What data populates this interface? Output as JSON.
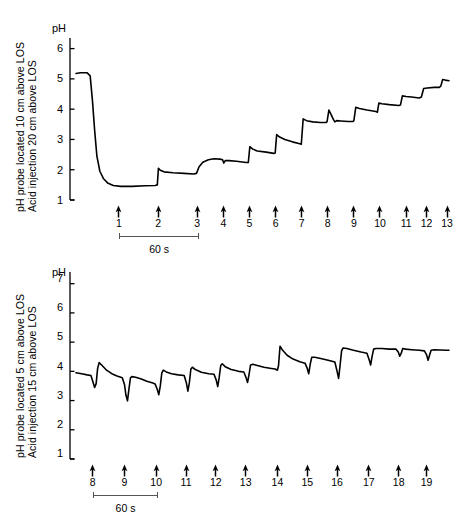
{
  "figure": {
    "background": "#ffffff",
    "trace_color": "#000000",
    "axis_color": "#000000"
  },
  "panels": [
    {
      "id": "top",
      "ylabel_line1": "pH probe located 10 cm above LOS",
      "ylabel_line2": "Acid injection 20 cm above LOS",
      "axis_title": "pH",
      "scalebar_label": "60 s"
    },
    {
      "id": "bottom",
      "ylabel_line1": "pH probe located 5 cm above LOS",
      "ylabel_line2": "Acid injection 15 cm above LOS",
      "axis_title": "pH",
      "scalebar_label": "60 s"
    }
  ],
  "chart_data": [
    {
      "type": "line",
      "id": "top-panel",
      "title": "pH probe located 10 cm above LOS / Acid injection 20 cm above LOS",
      "xlabel": "",
      "ylabel": "pH",
      "ylim": [
        1,
        6.5
      ],
      "yticks": [
        6,
        5,
        4,
        3,
        2,
        1
      ],
      "xlim": [
        0,
        100
      ],
      "grid": false,
      "legend": null,
      "time_scalebar_seconds": 60,
      "injection_markers": [
        {
          "label": "1",
          "x": 11.5
        },
        {
          "label": "2",
          "x": 22.0
        },
        {
          "label": "3",
          "x": 32.5
        },
        {
          "label": "4",
          "x": 39.5
        },
        {
          "label": "5",
          "x": 46.5
        },
        {
          "label": "6",
          "x": 53.5
        },
        {
          "label": "7",
          "x": 60.5
        },
        {
          "label": "8",
          "x": 67.5
        },
        {
          "label": "9",
          "x": 74.5
        },
        {
          "label": "10",
          "x": 81.5
        },
        {
          "label": "11",
          "x": 88.5
        },
        {
          "label": "12",
          "x": 94.0
        },
        {
          "label": "13",
          "x": 99.5
        }
      ],
      "series": [
        {
          "name": "pH trace (10 cm above LOS)",
          "points": [
            [
              0.0,
              5.18
            ],
            [
              1.2,
              5.2
            ],
            [
              3.0,
              5.2
            ],
            [
              3.8,
              5.1
            ],
            [
              4.4,
              4.3
            ],
            [
              5.0,
              3.3
            ],
            [
              5.6,
              2.45
            ],
            [
              6.4,
              1.95
            ],
            [
              7.4,
              1.7
            ],
            [
              8.6,
              1.55
            ],
            [
              10.0,
              1.48
            ],
            [
              12.0,
              1.45
            ],
            [
              15.0,
              1.45
            ],
            [
              18.5,
              1.47
            ],
            [
              21.2,
              1.48
            ],
            [
              21.8,
              1.5
            ],
            [
              22.1,
              2.05
            ],
            [
              22.6,
              1.98
            ],
            [
              23.6,
              1.93
            ],
            [
              26.0,
              1.9
            ],
            [
              29.0,
              1.88
            ],
            [
              31.5,
              1.86
            ],
            [
              32.3,
              1.88
            ],
            [
              33.0,
              2.1
            ],
            [
              34.0,
              2.25
            ],
            [
              35.5,
              2.33
            ],
            [
              37.0,
              2.36
            ],
            [
              38.6,
              2.35
            ],
            [
              39.3,
              2.33
            ],
            [
              39.6,
              2.22
            ],
            [
              40.0,
              2.3
            ],
            [
              41.0,
              2.3
            ],
            [
              43.0,
              2.28
            ],
            [
              45.6,
              2.24
            ],
            [
              46.2,
              2.24
            ],
            [
              46.6,
              2.76
            ],
            [
              47.4,
              2.68
            ],
            [
              48.6,
              2.62
            ],
            [
              51.0,
              2.58
            ],
            [
              53.0,
              2.54
            ],
            [
              53.4,
              2.55
            ],
            [
              53.8,
              3.16
            ],
            [
              54.6,
              3.08
            ],
            [
              56.0,
              3.0
            ],
            [
              58.0,
              2.92
            ],
            [
              60.0,
              2.86
            ],
            [
              60.4,
              2.84
            ],
            [
              60.9,
              3.68
            ],
            [
              61.8,
              3.62
            ],
            [
              63.5,
              3.58
            ],
            [
              65.5,
              3.56
            ],
            [
              67.0,
              3.56
            ],
            [
              67.3,
              3.58
            ],
            [
              67.8,
              3.97
            ],
            [
              68.4,
              3.82
            ],
            [
              69.0,
              3.66
            ],
            [
              69.4,
              3.58
            ],
            [
              69.9,
              3.62
            ],
            [
              71.0,
              3.61
            ],
            [
              73.0,
              3.59
            ],
            [
              74.2,
              3.59
            ],
            [
              74.5,
              3.62
            ],
            [
              75.0,
              4.06
            ],
            [
              76.0,
              4.02
            ],
            [
              78.0,
              3.97
            ],
            [
              80.4,
              3.92
            ],
            [
              80.8,
              3.9
            ],
            [
              81.2,
              4.2
            ],
            [
              82.0,
              4.18
            ],
            [
              84.0,
              4.15
            ],
            [
              86.5,
              4.12
            ],
            [
              87.0,
              4.14
            ],
            [
              87.5,
              4.44
            ],
            [
              88.5,
              4.42
            ],
            [
              90.0,
              4.4
            ],
            [
              92.0,
              4.37
            ],
            [
              92.6,
              4.4
            ],
            [
              93.2,
              4.68
            ],
            [
              94.2,
              4.7
            ],
            [
              96.0,
              4.72
            ],
            [
              97.4,
              4.72
            ],
            [
              97.8,
              4.76
            ],
            [
              98.3,
              4.98
            ],
            [
              99.0,
              4.96
            ],
            [
              100.0,
              4.94
            ]
          ]
        }
      ]
    },
    {
      "type": "line",
      "id": "bottom-panel",
      "title": "pH probe located 5 cm above LOS / Acid injection 15 cm above LOS",
      "xlabel": "",
      "ylabel": "pH",
      "ylim": [
        1,
        7.5
      ],
      "yticks": [
        7,
        6,
        5,
        4,
        3,
        2,
        1
      ],
      "xlim": [
        0,
        100
      ],
      "grid": false,
      "legend": null,
      "time_scalebar_seconds": 60,
      "injection_markers": [
        {
          "label": "8",
          "x": 4.5
        },
        {
          "label": "9",
          "x": 13.0
        },
        {
          "label": "10",
          "x": 21.5
        },
        {
          "label": "11",
          "x": 29.5
        },
        {
          "label": "12",
          "x": 37.5
        },
        {
          "label": "13",
          "x": 45.5
        },
        {
          "label": "14",
          "x": 54.0
        },
        {
          "label": "15",
          "x": 62.0
        },
        {
          "label": "16",
          "x": 70.0
        },
        {
          "label": "17",
          "x": 78.5
        },
        {
          "label": "18",
          "x": 86.5
        },
        {
          "label": "19",
          "x": 94.0
        }
      ],
      "series": [
        {
          "name": "pH trace (5 cm above LOS)",
          "points": [
            [
              0.0,
              3.95
            ],
            [
              1.5,
              3.92
            ],
            [
              3.0,
              3.88
            ],
            [
              4.0,
              3.86
            ],
            [
              4.6,
              3.62
            ],
            [
              5.0,
              3.45
            ],
            [
              5.4,
              3.58
            ],
            [
              5.8,
              4.1
            ],
            [
              6.2,
              4.3
            ],
            [
              7.0,
              4.2
            ],
            [
              8.2,
              4.04
            ],
            [
              9.6,
              3.92
            ],
            [
              11.0,
              3.84
            ],
            [
              12.4,
              3.78
            ],
            [
              13.0,
              3.55
            ],
            [
              13.4,
              3.18
            ],
            [
              13.8,
              2.99
            ],
            [
              14.2,
              3.4
            ],
            [
              14.6,
              3.78
            ],
            [
              15.0,
              3.82
            ],
            [
              16.0,
              3.8
            ],
            [
              17.5,
              3.74
            ],
            [
              19.0,
              3.66
            ],
            [
              20.6,
              3.6
            ],
            [
              21.2,
              3.57
            ],
            [
              21.8,
              3.38
            ],
            [
              22.2,
              3.2
            ],
            [
              22.6,
              3.5
            ],
            [
              23.0,
              3.94
            ],
            [
              23.4,
              4.04
            ],
            [
              24.2,
              3.98
            ],
            [
              25.6,
              3.92
            ],
            [
              27.4,
              3.88
            ],
            [
              29.0,
              3.86
            ],
            [
              29.6,
              3.6
            ],
            [
              30.0,
              3.32
            ],
            [
              30.4,
              3.62
            ],
            [
              30.8,
              4.08
            ],
            [
              31.2,
              4.14
            ],
            [
              32.0,
              4.06
            ],
            [
              33.6,
              3.97
            ],
            [
              35.6,
              3.92
            ],
            [
              37.0,
              3.9
            ],
            [
              37.6,
              3.7
            ],
            [
              38.0,
              3.48
            ],
            [
              38.4,
              3.8
            ],
            [
              38.8,
              4.2
            ],
            [
              39.2,
              4.26
            ],
            [
              40.0,
              4.16
            ],
            [
              41.6,
              4.06
            ],
            [
              43.6,
              4.0
            ],
            [
              45.0,
              3.98
            ],
            [
              45.6,
              3.78
            ],
            [
              46.0,
              3.62
            ],
            [
              46.4,
              3.9
            ],
            [
              46.8,
              4.22
            ],
            [
              47.4,
              4.24
            ],
            [
              48.6,
              4.2
            ],
            [
              50.4,
              4.14
            ],
            [
              52.4,
              4.1
            ],
            [
              53.4,
              4.08
            ],
            [
              54.0,
              4.04
            ],
            [
              54.3,
              4.2
            ],
            [
              54.7,
              4.86
            ],
            [
              55.4,
              4.72
            ],
            [
              56.6,
              4.55
            ],
            [
              58.2,
              4.42
            ],
            [
              60.0,
              4.33
            ],
            [
              61.4,
              4.28
            ],
            [
              62.0,
              4.1
            ],
            [
              62.4,
              3.92
            ],
            [
              62.8,
              4.25
            ],
            [
              63.2,
              4.48
            ],
            [
              64.0,
              4.48
            ],
            [
              65.6,
              4.44
            ],
            [
              67.6,
              4.38
            ],
            [
              69.4,
              4.32
            ],
            [
              70.0,
              4.0
            ],
            [
              70.4,
              3.76
            ],
            [
              70.8,
              4.2
            ],
            [
              71.2,
              4.7
            ],
            [
              71.6,
              4.8
            ],
            [
              72.6,
              4.78
            ],
            [
              74.4,
              4.72
            ],
            [
              76.4,
              4.66
            ],
            [
              78.0,
              4.62
            ],
            [
              78.6,
              4.4
            ],
            [
              79.0,
              4.22
            ],
            [
              79.4,
              4.52
            ],
            [
              79.8,
              4.76
            ],
            [
              80.4,
              4.78
            ],
            [
              82.0,
              4.78
            ],
            [
              84.0,
              4.76
            ],
            [
              85.8,
              4.76
            ],
            [
              86.4,
              4.66
            ],
            [
              86.8,
              4.52
            ],
            [
              87.2,
              4.62
            ],
            [
              87.6,
              4.78
            ],
            [
              88.4,
              4.76
            ],
            [
              90.0,
              4.74
            ],
            [
              92.0,
              4.72
            ],
            [
              93.4,
              4.7
            ],
            [
              94.0,
              4.56
            ],
            [
              94.4,
              4.38
            ],
            [
              94.8,
              4.56
            ],
            [
              95.2,
              4.72
            ],
            [
              96.0,
              4.74
            ],
            [
              97.6,
              4.73
            ],
            [
              99.4,
              4.72
            ],
            [
              100.0,
              4.72
            ]
          ]
        }
      ]
    }
  ]
}
